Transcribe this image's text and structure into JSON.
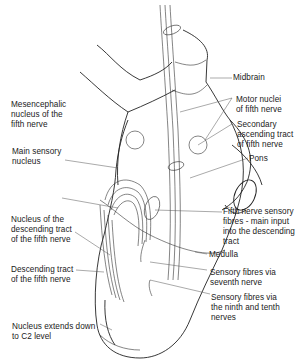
{
  "diagram": {
    "type": "anatomical-illustration",
    "labels": [
      {
        "id": "midbrain",
        "text": "Midbrain",
        "side": "right"
      },
      {
        "id": "motor-nuclei",
        "text": "Motor nuclei\nof fifth nerve",
        "side": "right"
      },
      {
        "id": "secondary-ascending-tract",
        "text": "Secondary\nascending tract\nof fifth nerve",
        "side": "right"
      },
      {
        "id": "pons",
        "text": "Pons",
        "side": "right"
      },
      {
        "id": "fifth-nerve-sensory-fibres",
        "text": "Fifth nerve sensory\nfibres - main input\ninto the descending\ntract",
        "side": "right"
      },
      {
        "id": "medulla",
        "text": "Medulla",
        "side": "right"
      },
      {
        "id": "sensory-fibres-seventh",
        "text": "Sensory fibres via\nseventh nerve",
        "side": "right"
      },
      {
        "id": "sensory-fibres-ninth-tenth",
        "text": "Sensory fibres via\nthe ninth and tenth\nnerves",
        "side": "right"
      },
      {
        "id": "mesencephalic-nucleus",
        "text": "Mesencephalic\nnucleus of the\nfifth nerve",
        "side": "left"
      },
      {
        "id": "main-sensory-nucleus",
        "text": "Main sensory\nnucleus",
        "side": "left"
      },
      {
        "id": "nucleus-descending-tract",
        "text": "Nucleus of the\ndescending tract\nof the fifth nerve",
        "side": "left"
      },
      {
        "id": "descending-tract",
        "text": "Descending tract\nof the fifth nerve",
        "side": "left"
      },
      {
        "id": "nucleus-extends-c2",
        "text": "Nucleus extends down\nto C2 level",
        "side": "left"
      }
    ]
  }
}
